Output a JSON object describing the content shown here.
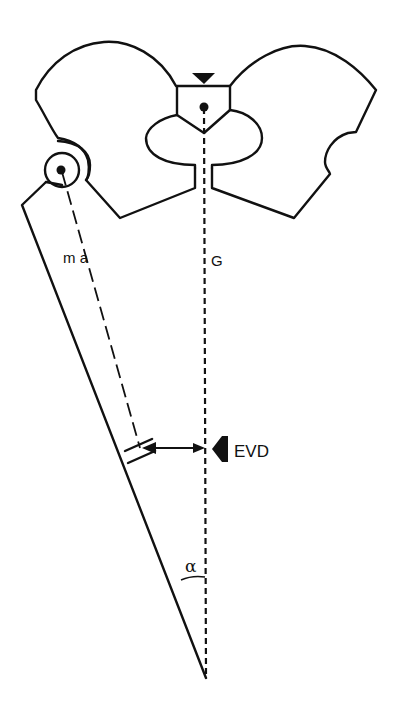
{
  "diagram": {
    "type": "anatomical-schematic",
    "colors": {
      "stroke": "#111111",
      "background": "#ffffff"
    },
    "labels": {
      "mechanical_axis": "m a",
      "gravity_line": "G",
      "force": "EVD",
      "angle": "α"
    },
    "elements": [
      {
        "name": "pelvis-outline",
        "shape": "butterfly pelvis outline with central sacrum"
      },
      {
        "name": "sacrum-marker",
        "shape": "downward triangle above sacrum"
      },
      {
        "name": "sacrum-center-point",
        "shape": "filled dot"
      },
      {
        "name": "femoral-head",
        "shape": "circle with center dot"
      },
      {
        "name": "femur-shaft",
        "shape": "tapered line to knee"
      },
      {
        "name": "mechanical-axis-line",
        "style": "long-dash"
      },
      {
        "name": "gravity-line",
        "style": "short-dash vertical"
      },
      {
        "name": "distance-arrow",
        "style": "double-headed horizontal"
      },
      {
        "name": "force-arrow",
        "style": "filled left-pointing arrowhead"
      },
      {
        "name": "angle-arc",
        "label": "α"
      }
    ]
  }
}
